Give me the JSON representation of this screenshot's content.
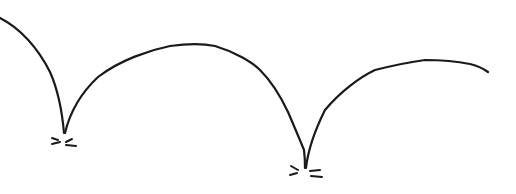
{
  "drawing": {
    "subject": "bouncing-ball-trajectory-sketch",
    "background": "#ffffff",
    "ink_color": "#1a1a1a",
    "stroke_width": 2.2,
    "arcs": [
      {
        "name": "descent-arc",
        "d": "M 0 18 C 20 28, 38 48, 50 72 C 58 90, 62 110, 64 133"
      },
      {
        "name": "bounce-arc-1",
        "d": "M 65 133 C 70 112, 82 92, 98 77 C 120 60, 150 50, 170 46 C 185 44, 200 43, 215 46 C 235 52, 252 62, 260 70 C 272 82, 280 95, 288 112 C 294 126, 300 140, 304 150 C 305 158, 305 164, 305 168"
      },
      {
        "name": "bounce-arc-2",
        "d": "M 306 168 C 308 150, 314 132, 325 110 C 340 92, 360 77, 375 70 C 395 65, 410 62, 425 60 C 445 60, 460 62, 470 64 C 478 66, 484 69, 488 72"
      }
    ],
    "impact_marks": [
      {
        "name": "impact-mark-1",
        "lines": [
          "M 52 138 L 58 140",
          "M 52 144 L 60 142",
          "M 66 142 L 72 139",
          "M 66 145 L 76 146"
        ]
      },
      {
        "name": "impact-mark-2",
        "lines": [
          "M 291 166 L 298 170",
          "M 290 175 L 297 173",
          "M 310 171 L 320 170",
          "M 311 176 L 322 177"
        ]
      }
    ]
  }
}
